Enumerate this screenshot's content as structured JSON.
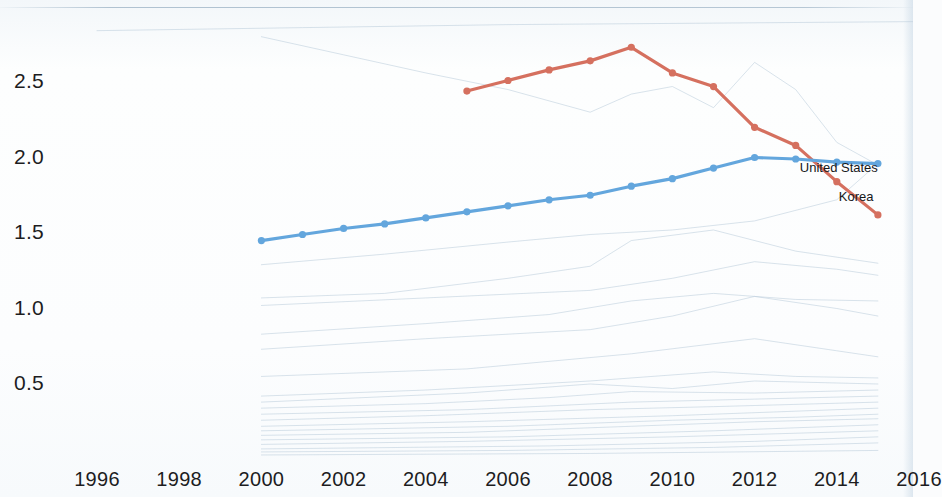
{
  "chart_data": {
    "type": "line",
    "title": "",
    "subtitle": "",
    "xlabel": "",
    "ylabel": "",
    "xlim": [
      1995,
      2016.6
    ],
    "ylim": [
      0.0,
      2.85
    ],
    "grid": false,
    "legend_position": "inline-end-of-line",
    "x_ticks": [
      1996,
      1998,
      2000,
      2002,
      2004,
      2006,
      2008,
      2010,
      2012,
      2014,
      2016
    ],
    "x_tick_labels": [
      "1996",
      "1998",
      "2000",
      "2002",
      "2004",
      "2006",
      "2008",
      "2010",
      "2012",
      "2014",
      "2016"
    ],
    "y_ticks": [
      0.5,
      1.0,
      1.5,
      2.0,
      2.5
    ],
    "y_tick_labels": [
      "0.5",
      "1.0",
      "1.5",
      "2.0",
      "2.5"
    ],
    "colors": {
      "korea": "#d5705f",
      "united_states": "#63a6dd",
      "background_series": "#b9ccda",
      "tick_text": "#1d1d1f",
      "page_background": "#fbfcfd"
    },
    "series": [
      {
        "name": "Korea",
        "label": "Korea",
        "color": "#d5705f",
        "highlighted": true,
        "markers": true,
        "label_x": 2014.05,
        "label_y": 1.74,
        "x": [
          2005,
          2006,
          2007,
          2008,
          2009,
          2010,
          2011,
          2012,
          2013,
          2014,
          2015
        ],
        "y": [
          2.44,
          2.51,
          2.58,
          2.64,
          2.73,
          2.56,
          2.47,
          2.2,
          2.08,
          1.84,
          1.62
        ]
      },
      {
        "name": "United States",
        "label": "United States",
        "color": "#63a6dd",
        "highlighted": true,
        "markers": true,
        "label_x": 2013.1,
        "label_y": 1.93,
        "x": [
          2000,
          2001,
          2002,
          2003,
          2004,
          2005,
          2006,
          2007,
          2008,
          2009,
          2010,
          2011,
          2012,
          2013,
          2014,
          2015
        ],
        "y": [
          1.45,
          1.49,
          1.53,
          1.56,
          1.6,
          1.64,
          1.68,
          1.72,
          1.75,
          1.81,
          1.86,
          1.93,
          2.0,
          1.99,
          1.97,
          1.96
        ]
      },
      {
        "name": "background-series-1",
        "color": "#b9ccda",
        "highlighted": false,
        "markers": false,
        "x": [
          2000,
          2002,
          2004,
          2006,
          2008,
          2009,
          2010,
          2011,
          2012,
          2013,
          2014,
          2015
        ],
        "y": [
          2.8,
          2.68,
          2.56,
          2.45,
          2.3,
          2.42,
          2.47,
          2.33,
          2.63,
          2.45,
          2.1,
          1.95
        ]
      },
      {
        "name": "background-series-2",
        "color": "#b9ccda",
        "highlighted": false,
        "markers": false,
        "x": [
          2000,
          2003,
          2006,
          2008,
          2010,
          2012,
          2014,
          2015
        ],
        "y": [
          1.29,
          1.36,
          1.44,
          1.49,
          1.52,
          1.58,
          1.72,
          1.96
        ]
      },
      {
        "name": "background-series-3",
        "color": "#b9ccda",
        "highlighted": false,
        "markers": false,
        "x": [
          2000,
          2003,
          2006,
          2008,
          2009,
          2011,
          2013,
          2015
        ],
        "y": [
          1.07,
          1.1,
          1.2,
          1.28,
          1.45,
          1.52,
          1.38,
          1.3
        ]
      },
      {
        "name": "background-series-4",
        "color": "#b9ccda",
        "highlighted": false,
        "markers": false,
        "x": [
          2000,
          2004,
          2008,
          2010,
          2012,
          2014,
          2015
        ],
        "y": [
          1.02,
          1.07,
          1.12,
          1.2,
          1.31,
          1.26,
          1.22
        ]
      },
      {
        "name": "background-series-5",
        "color": "#b9ccda",
        "highlighted": false,
        "markers": false,
        "x": [
          2000,
          2004,
          2007,
          2009,
          2011,
          2013,
          2015
        ],
        "y": [
          0.83,
          0.9,
          0.96,
          1.05,
          1.1,
          1.06,
          1.05
        ]
      },
      {
        "name": "background-series-6",
        "color": "#b9ccda",
        "highlighted": false,
        "markers": false,
        "x": [
          2000,
          2004,
          2008,
          2010,
          2012,
          2014,
          2015
        ],
        "y": [
          0.73,
          0.8,
          0.86,
          0.95,
          1.08,
          1.0,
          0.95
        ]
      },
      {
        "name": "background-series-7",
        "color": "#b9ccda",
        "highlighted": false,
        "markers": false,
        "x": [
          2000,
          2005,
          2009,
          2012,
          2014,
          2015
        ],
        "y": [
          0.55,
          0.6,
          0.7,
          0.8,
          0.72,
          0.68
        ]
      },
      {
        "name": "background-series-8",
        "color": "#b9ccda",
        "highlighted": false,
        "markers": false,
        "x": [
          2000,
          2004,
          2008,
          2011,
          2013,
          2015
        ],
        "y": [
          0.42,
          0.46,
          0.52,
          0.58,
          0.55,
          0.54
        ]
      },
      {
        "name": "background-series-9",
        "color": "#b9ccda",
        "highlighted": false,
        "markers": false,
        "x": [
          2000,
          2005,
          2008,
          2010,
          2012,
          2015
        ],
        "y": [
          0.38,
          0.44,
          0.5,
          0.47,
          0.52,
          0.5
        ]
      },
      {
        "name": "background-series-10",
        "color": "#b9ccda",
        "highlighted": false,
        "markers": false,
        "x": [
          2000,
          2004,
          2007,
          2009,
          2012,
          2015
        ],
        "y": [
          0.34,
          0.37,
          0.41,
          0.45,
          0.44,
          0.46
        ]
      },
      {
        "name": "background-series-11",
        "color": "#b9ccda",
        "highlighted": false,
        "markers": false,
        "x": [
          2000,
          2005,
          2009,
          2012,
          2015
        ],
        "y": [
          0.3,
          0.33,
          0.38,
          0.4,
          0.42
        ]
      },
      {
        "name": "background-series-12",
        "color": "#b9ccda",
        "highlighted": false,
        "markers": false,
        "x": [
          2000,
          2004,
          2008,
          2011,
          2015
        ],
        "y": [
          0.26,
          0.29,
          0.33,
          0.35,
          0.38
        ]
      },
      {
        "name": "background-series-13",
        "color": "#b9ccda",
        "highlighted": false,
        "markers": false,
        "x": [
          2000,
          2005,
          2010,
          2013,
          2015
        ],
        "y": [
          0.22,
          0.25,
          0.29,
          0.32,
          0.34
        ]
      },
      {
        "name": "background-series-14",
        "color": "#b9ccda",
        "highlighted": false,
        "markers": false,
        "x": [
          2000,
          2006,
          2010,
          2013,
          2015
        ],
        "y": [
          0.19,
          0.22,
          0.26,
          0.28,
          0.3
        ]
      },
      {
        "name": "background-series-15",
        "color": "#b9ccda",
        "highlighted": false,
        "markers": false,
        "x": [
          2000,
          2005,
          2009,
          2012,
          2015
        ],
        "y": [
          0.16,
          0.18,
          0.22,
          0.25,
          0.27
        ]
      },
      {
        "name": "background-series-16",
        "color": "#b9ccda",
        "highlighted": false,
        "markers": false,
        "x": [
          2000,
          2006,
          2011,
          2015
        ],
        "y": [
          0.13,
          0.15,
          0.19,
          0.23
        ]
      },
      {
        "name": "background-series-17",
        "color": "#b9ccda",
        "highlighted": false,
        "markers": false,
        "x": [
          2000,
          2005,
          2010,
          2015
        ],
        "y": [
          0.1,
          0.12,
          0.15,
          0.19
        ]
      },
      {
        "name": "background-series-18",
        "color": "#b9ccda",
        "highlighted": false,
        "markers": false,
        "x": [
          2000,
          2007,
          2012,
          2015
        ],
        "y": [
          0.07,
          0.09,
          0.12,
          0.15
        ]
      },
      {
        "name": "background-series-19",
        "color": "#b9ccda",
        "highlighted": false,
        "markers": false,
        "x": [
          2000,
          2006,
          2011,
          2015
        ],
        "y": [
          0.05,
          0.06,
          0.08,
          0.11
        ]
      },
      {
        "name": "background-series-20",
        "color": "#b9ccda",
        "highlighted": false,
        "markers": false,
        "x": [
          2000,
          2008,
          2015
        ],
        "y": [
          0.03,
          0.04,
          0.06
        ]
      },
      {
        "name": "background-series-21",
        "color": "#b9ccda",
        "highlighted": false,
        "markers": false,
        "x": [
          1996,
          2001,
          2006,
          2011,
          2016
        ],
        "y": [
          2.84,
          2.86,
          2.88,
          2.89,
          2.9
        ]
      }
    ]
  }
}
